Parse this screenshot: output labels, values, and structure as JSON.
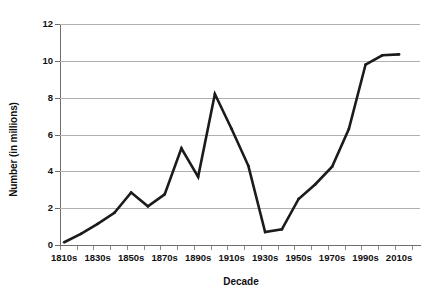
{
  "chart_data": {
    "type": "line",
    "title": "",
    "xlabel": "Decade",
    "ylabel": "Number (in millions)",
    "categories": [
      "1810s",
      "1820s",
      "1830s",
      "1840s",
      "1850s",
      "1860s",
      "1870s",
      "1880s",
      "1890s",
      "1900s",
      "1910s",
      "1920s",
      "1930s",
      "1940s",
      "1950s",
      "1960s",
      "1970s",
      "1980s",
      "1990s",
      "2000s",
      "2010s"
    ],
    "values": [
      0.15,
      0.6,
      1.15,
      1.75,
      2.85,
      2.1,
      2.75,
      5.25,
      3.7,
      8.2,
      6.3,
      4.3,
      0.7,
      0.85,
      2.5,
      3.3,
      4.25,
      6.3,
      9.8,
      10.3,
      10.35
    ],
    "ylim": [
      0,
      12
    ],
    "yticks": [
      0,
      2,
      4,
      6,
      8,
      10,
      12
    ],
    "ytick_labels": [
      "0",
      "2",
      "4",
      "6",
      "8",
      "10",
      "12"
    ],
    "xtick_labels": [
      "1810s",
      "1830s",
      "1850s",
      "1870s",
      "1890s",
      "1910s",
      "1930s",
      "1950s",
      "1970s",
      "1990s",
      "2010s"
    ],
    "xtick_label_indices": [
      0,
      2,
      4,
      6,
      8,
      10,
      12,
      14,
      16,
      18,
      20
    ],
    "grid": "horizontal",
    "legend": "none",
    "series_color": "#1b1b1b",
    "gridline_color": "#b0b0b0",
    "axis_color": "#6d6d6d",
    "background": "#ffffff"
  }
}
